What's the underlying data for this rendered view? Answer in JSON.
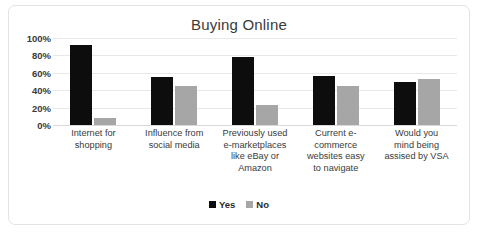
{
  "chart_data": {
    "type": "bar",
    "title": "Buying Online",
    "xlabel": "",
    "ylabel": "",
    "ylim": [
      0,
      100
    ],
    "ytick_labels": [
      "100%",
      "80%",
      "60%",
      "40%",
      "20%",
      "0%"
    ],
    "ytick_values": [
      100,
      80,
      60,
      40,
      20,
      0
    ],
    "grid": true,
    "legend_position": "bottom-center",
    "categories": [
      "Internet for shopping",
      "Influence from social media",
      "Previously used e-marketplaces like eBay or Amazon",
      "Current e-commerce websites easy to navigate",
      "Would you mind being assised by VSA"
    ],
    "category_label_lines": [
      [
        "Internet for",
        "shopping"
      ],
      [
        "Influence from",
        "social media"
      ],
      [
        "Previously used",
        "e-marketplaces",
        "like eBay or",
        "Amazon"
      ],
      [
        "Current e-",
        "commerce",
        "websites easy",
        "to navigate"
      ],
      [
        "Would you",
        "mind being",
        "assised by VSA"
      ]
    ],
    "series": [
      {
        "name": "Yes",
        "color": "#0d0d0d",
        "values": [
          92,
          55,
          78,
          56,
          49
        ]
      },
      {
        "name": "No",
        "color": "#a6a6a6",
        "values": [
          8,
          45,
          23,
          45,
          53
        ]
      }
    ]
  },
  "legend": {
    "items": [
      {
        "label": "Yes"
      },
      {
        "label": "No"
      }
    ]
  },
  "colors": {
    "yes": "#0d0d0d",
    "no": "#a6a6a6",
    "gridline": "#e8e8e8",
    "border": "#e3e3e3",
    "text": "#3a3a3a",
    "background": "#ffffff"
  }
}
